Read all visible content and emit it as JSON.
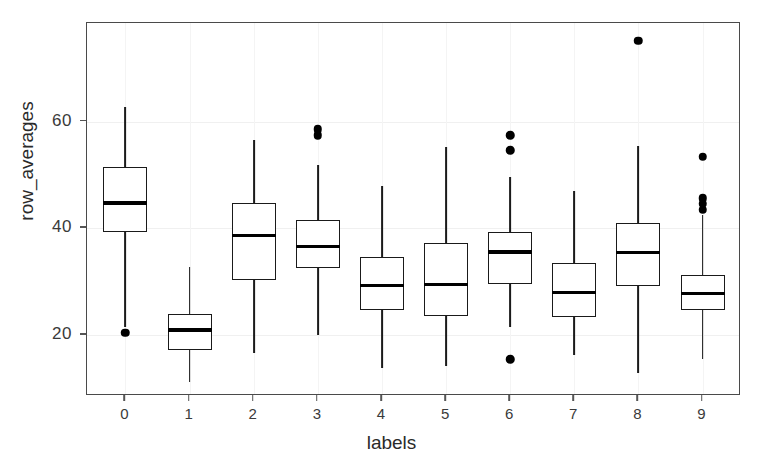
{
  "chart_data": {
    "type": "box",
    "title": "",
    "xlabel": "labels",
    "ylabel": "row_averages",
    "categories": [
      "0",
      "1",
      "2",
      "3",
      "4",
      "5",
      "6",
      "7",
      "8",
      "9"
    ],
    "xtick_labels": [
      "0",
      "1",
      "2",
      "3",
      "4",
      "5",
      "6",
      "7",
      "8",
      "9"
    ],
    "ytick_labels": [
      "20",
      "40",
      "60"
    ],
    "ytick_values": [
      20,
      40,
      60
    ],
    "ylim": [
      8.5,
      78.5
    ],
    "xlim": [
      -0.6,
      9.6
    ],
    "grid": true,
    "legend": "none",
    "orientation": "vertical",
    "box_color": "#ffffff",
    "line_color": "#1a1a1a",
    "outlier_color": "#000000",
    "boxes": [
      {
        "label": "0",
        "whisker_low": 21.5,
        "q1": 39.2,
        "median": 44.7,
        "q3": 51.5,
        "whisker_high": 62.8,
        "outliers": [
          20.4
        ]
      },
      {
        "label": "1",
        "whisker_low": 11.2,
        "q1": 17.2,
        "median": 20.9,
        "q3": 23.8,
        "whisker_high": 32.8,
        "outliers": []
      },
      {
        "label": "2",
        "whisker_low": 16.6,
        "q1": 30.2,
        "median": 38.6,
        "q3": 44.7,
        "whisker_high": 56.5,
        "outliers": []
      },
      {
        "label": "3",
        "whisker_low": 19.9,
        "q1": 32.6,
        "median": 36.5,
        "q3": 41.5,
        "whisker_high": 51.8,
        "outliers": [
          57.4,
          58.6
        ]
      },
      {
        "label": "4",
        "whisker_low": 13.7,
        "q1": 24.6,
        "median": 29.2,
        "q3": 34.6,
        "whisker_high": 48.0,
        "outliers": []
      },
      {
        "label": "5",
        "whisker_low": 14.2,
        "q1": 23.6,
        "median": 29.4,
        "q3": 37.3,
        "whisker_high": 55.2,
        "outliers": []
      },
      {
        "label": "6",
        "whisker_low": 21.4,
        "q1": 29.6,
        "median": 35.5,
        "q3": 39.3,
        "whisker_high": 49.6,
        "outliers": [
          15.4,
          54.6,
          57.4
        ]
      },
      {
        "label": "7",
        "whisker_low": 16.2,
        "q1": 23.4,
        "median": 27.9,
        "q3": 33.5,
        "whisker_high": 47.0,
        "outliers": []
      },
      {
        "label": "8",
        "whisker_low": 12.9,
        "q1": 29.2,
        "median": 35.4,
        "q3": 41.0,
        "whisker_high": 55.4,
        "outliers": [
          75.2
        ]
      },
      {
        "label": "9",
        "whisker_low": 15.4,
        "q1": 24.7,
        "median": 27.7,
        "q3": 31.3,
        "whisker_high": 42.4,
        "outliers": [
          43.5,
          44.6,
          45.6,
          53.4
        ]
      }
    ]
  }
}
